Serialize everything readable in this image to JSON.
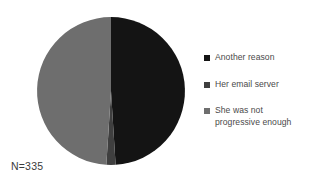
{
  "chart_data": {
    "type": "pie",
    "title": "",
    "categories": [
      "Another reason",
      "Her email server",
      "She was not progressive enough"
    ],
    "values": [
      49,
      2,
      49
    ],
    "colors": [
      "#141414",
      "#3f3f3f",
      "#6e6e6e"
    ],
    "legend_position": "right",
    "grid": false,
    "annotations": [
      "N=335"
    ],
    "sample_size_label": "N=335",
    "start_angle_deg": 0,
    "direction": "clockwise"
  },
  "figure": {
    "sample_size": "N=335"
  },
  "legend": {
    "entries": [
      {
        "label": "Another reason",
        "color": "#141414"
      },
      {
        "label": "Her email server",
        "color": "#3f3f3f"
      },
      {
        "label": "She was not progressive enough",
        "color": "#6e6e6e"
      }
    ]
  }
}
